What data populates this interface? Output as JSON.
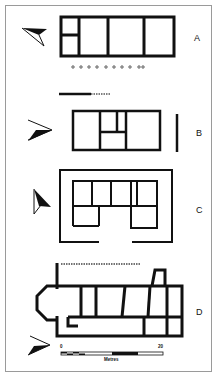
{
  "figure": {
    "frame_color": "#9a9a9a",
    "ink_color": "#111111",
    "background": "#ffffff",
    "plans": [
      {
        "id": "A",
        "label": "A"
      },
      {
        "id": "B",
        "label": "B"
      },
      {
        "id": "C",
        "label": "C"
      },
      {
        "id": "D",
        "label": "D"
      }
    ],
    "scale": {
      "start": "0",
      "end": "20",
      "unit": "Metres"
    },
    "icons": [
      "north-arrow-icon-a",
      "north-arrow-icon-b",
      "north-arrow-icon-c",
      "north-arrow-icon-d"
    ]
  }
}
